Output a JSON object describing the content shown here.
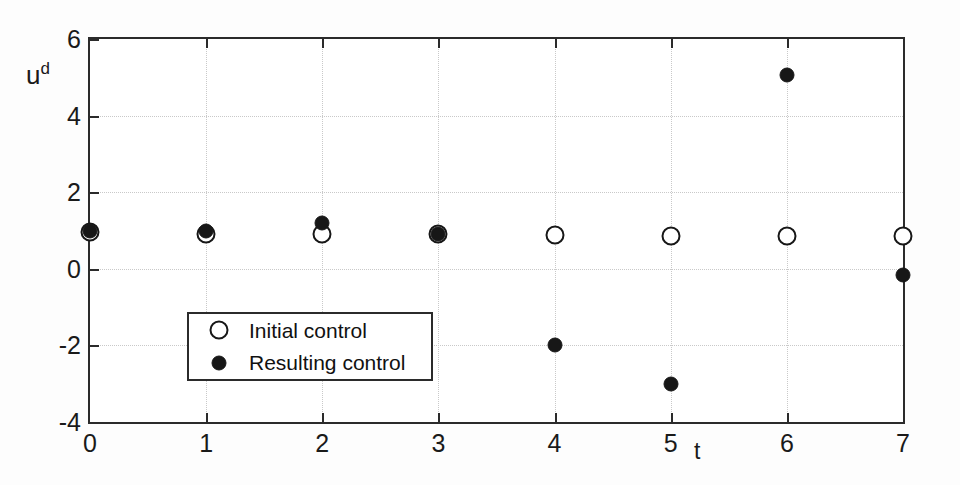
{
  "chart_data": {
    "type": "scatter",
    "title": "",
    "xlabel": "t",
    "ylabel": "u^d",
    "ylabel_base": "u",
    "ylabel_sup": "d",
    "xlim": [
      0,
      7
    ],
    "ylim": [
      -4,
      6
    ],
    "xticks": [
      0,
      1,
      2,
      3,
      4,
      5,
      6,
      7
    ],
    "xtick_labels": [
      "0",
      "1",
      "2",
      "3",
      "4",
      "5",
      "6",
      "7"
    ],
    "yticks": [
      -4,
      -2,
      0,
      2,
      4,
      6
    ],
    "ytick_labels": [
      "-4",
      "-2",
      "0",
      "2",
      "4",
      "6"
    ],
    "grid": true,
    "grid_style": "dotted",
    "legend_position": "lower-left-inside",
    "x": [
      0,
      1,
      2,
      3,
      4,
      5,
      6,
      7
    ],
    "series": [
      {
        "name": "Initial control",
        "marker": "open-circle",
        "color": "#171717",
        "values": [
          0.95,
          0.9,
          0.9,
          0.9,
          0.88,
          0.86,
          0.86,
          0.85
        ]
      },
      {
        "name": "Resulting control",
        "marker": "filled-circle",
        "color": "#171717",
        "values": [
          1.0,
          1.0,
          1.2,
          0.9,
          -2.0,
          -3.0,
          5.05,
          -0.15
        ]
      }
    ]
  },
  "legend": {
    "entries": [
      {
        "label": "Initial control",
        "marker": "open-circle"
      },
      {
        "label": "Resulting control",
        "marker": "filled-circle"
      }
    ]
  },
  "axes": {
    "y_title_base": "u",
    "y_title_sup": "d",
    "x_title": "t"
  }
}
